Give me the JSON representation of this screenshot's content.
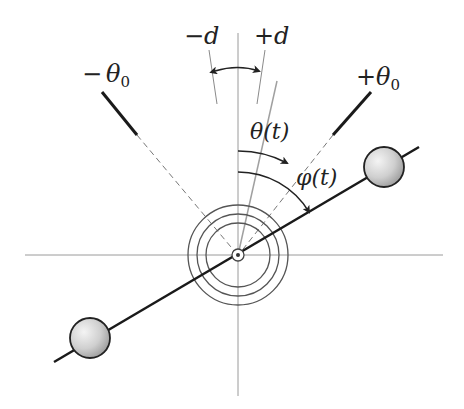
{
  "figure": {
    "type": "pendulum-angle-schematic",
    "labels": {
      "minus_d": "−d",
      "plus_d": "+d",
      "minus_theta0_sign": "−",
      "minus_theta0_sym": "θ",
      "minus_theta0_sub": "0",
      "plus_theta0_sign": "+",
      "plus_theta0_sym": "θ",
      "plus_theta0_sub": "0",
      "theta_t": "θ(t)",
      "phi_t": "φ(t)"
    },
    "colors": {
      "rod": "#1a1a1a",
      "axis": "#9a9a9a",
      "circle": "#555555",
      "ball_fill_light": "#f2f2f2",
      "ball_fill_dark": "#a8a8a8",
      "theta_line": "#a0a0a0"
    },
    "elements": [
      "horizontal-axis",
      "vertical-axis",
      "minus-theta0-limit",
      "plus-theta0-limit",
      "minus-d-line",
      "plus-d-line",
      "d-range-arrow",
      "theta-t-line",
      "theta-t-arc-arrow",
      "phi-t-arc-arrow",
      "pendulum-rod",
      "upper-ball",
      "lower-ball",
      "concentric-circles",
      "pivot"
    ]
  }
}
